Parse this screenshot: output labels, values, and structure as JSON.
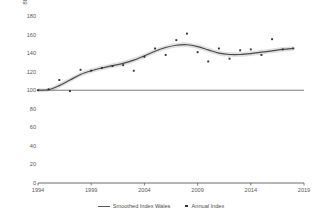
{
  "chart_data": {
    "type": "line",
    "title": "",
    "xlabel": "",
    "ylabel": "BBS Index",
    "xlim": [
      1994,
      2019
    ],
    "ylim": [
      0,
      180
    ],
    "ytick_values": [
      0,
      20,
      40,
      60,
      80,
      100,
      120,
      140,
      160,
      180
    ],
    "xtick_values": [
      1994,
      1999,
      2004,
      2009,
      2014,
      2019
    ],
    "ytick_labels": [
      "0",
      "20",
      "40",
      "60",
      "80",
      "100",
      "120",
      "140",
      "160",
      "180"
    ],
    "xtick_labels": [
      "1994",
      "1999",
      "2004",
      "2009",
      "2014",
      "2019"
    ],
    "grid": false,
    "legend_position": "bottom",
    "reference_line": 100,
    "x": [
      1994,
      1995,
      1996,
      1997,
      1998,
      1999,
      2000,
      2001,
      2002,
      2003,
      2004,
      2005,
      2006,
      2007,
      2008,
      2009,
      2010,
      2011,
      2012,
      2013,
      2014,
      2015,
      2016,
      2017,
      2018
    ],
    "series": [
      {
        "name": "Annual Index",
        "type": "scatter",
        "marker": "square",
        "color": "#333333",
        "values": [
          100,
          101,
          111,
          99,
          122,
          121,
          124,
          126,
          127,
          121,
          136,
          145,
          138,
          154,
          161,
          141,
          131,
          145,
          134,
          143,
          144,
          138,
          155,
          144,
          145
        ]
      },
      {
        "name": "Smoothed Index Wales",
        "type": "line",
        "color": "#4d4d4d",
        "band_color": "#d9d9d9",
        "values": [
          100,
          100.5,
          105,
          111,
          117,
          121,
          124,
          126.5,
          129,
          132.5,
          137,
          142,
          146,
          148.5,
          149,
          147,
          143.5,
          140,
          138.5,
          138.5,
          139.5,
          141,
          142.5,
          144,
          145
        ],
        "band_lower": [
          98,
          98.5,
          102.5,
          108.5,
          114.5,
          118.5,
          121.5,
          124,
          126.5,
          130,
          134.5,
          139.5,
          143.5,
          146,
          146.5,
          144.5,
          141,
          137.5,
          136,
          136,
          137,
          138.5,
          140,
          141.5,
          142.5
        ],
        "band_upper": [
          102,
          102.5,
          107.5,
          113.5,
          119.5,
          123.5,
          126.5,
          129,
          131.5,
          135,
          139.5,
          144.5,
          148.5,
          151,
          151.5,
          149.5,
          146,
          142.5,
          141,
          141,
          142,
          143.5,
          145,
          146.5,
          147.5
        ]
      }
    ]
  },
  "legend": {
    "entries": [
      {
        "label": "Smoothed Index Wales",
        "marker": "line"
      },
      {
        "label": "Annual Index",
        "marker": "square"
      }
    ]
  },
  "axis": {
    "y_title": "BBS Index"
  }
}
